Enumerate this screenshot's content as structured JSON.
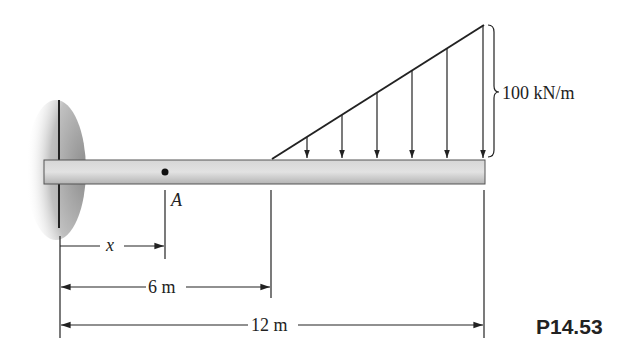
{
  "figure": {
    "type": "cantilever-beam-with-triangular-distributed-load",
    "labels": {
      "load_intensity": "100 kN/m",
      "point": "A",
      "variable": "x",
      "dim_6": "6 m",
      "dim_12": "12 m",
      "problem_number": "P14.53"
    },
    "beam": {
      "length_m": 12,
      "support": "fixed-wall-left",
      "point_A_position": "x"
    },
    "load": {
      "shape": "triangular",
      "start_m": 6,
      "end_m": 12,
      "max_intensity": "100 kN/m",
      "arrow_count": 6
    },
    "colors": {
      "line": "#222222",
      "beam_fill": "#c8c8c8",
      "wall_shadow": "#9a9a9a"
    }
  }
}
